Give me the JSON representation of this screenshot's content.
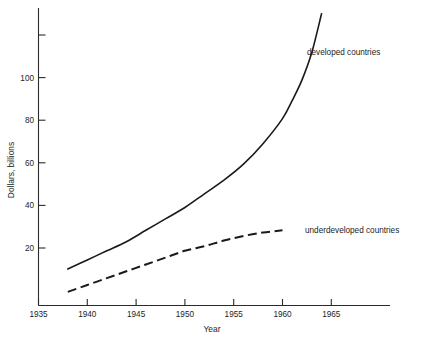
{
  "chart_data": {
    "type": "line",
    "title": "",
    "xlabel": "Year",
    "ylabel": "Dollars, billions",
    "xlim": [
      1935,
      1972
    ],
    "ylim": [
      0,
      128
    ],
    "grid": false,
    "legend_position": "inline-right-of-curves",
    "x_ticks": [
      1935,
      1940,
      1945,
      1950,
      1955,
      1960,
      1965
    ],
    "x_tick_labels": [
      "1935",
      "1940",
      "1945",
      "1950",
      "1955",
      "1960",
      "1965"
    ],
    "y_ticks": [
      20,
      40,
      60,
      80,
      100,
      120
    ],
    "y_tick_labels": [
      "20",
      "40",
      "60",
      "80",
      "100",
      ""
    ],
    "series": [
      {
        "name": "developed countries",
        "style": "solid",
        "label": "developed countries",
        "x": [
          1938,
          1940,
          1942,
          1944,
          1946,
          1948,
          1950,
          1952,
          1954,
          1956,
          1958,
          1960,
          1961,
          1962,
          1963,
          1964
        ],
        "values": [
          16,
          20,
          24,
          28,
          33,
          38,
          43,
          49,
          55,
          62,
          71,
          82,
          90,
          99,
          111,
          128
        ]
      },
      {
        "name": "underdeveloped countries",
        "style": "dashed",
        "label": "underdeveloped countries",
        "x": [
          1938,
          1940,
          1942,
          1944,
          1946,
          1948,
          1950,
          1952,
          1954,
          1956,
          1958,
          1960
        ],
        "values": [
          6,
          9,
          12,
          15,
          18,
          21,
          24,
          26,
          28.5,
          30.5,
          32,
          33
        ]
      }
    ]
  },
  "axes": {
    "x_title": "Year",
    "y_title": "Dollars, billions"
  },
  "labels": {
    "developed": "developed countries",
    "underdeveloped": "underdeveloped countries"
  },
  "ticks": {
    "x": [
      "1935",
      "1940",
      "1945",
      "1950",
      "1955",
      "1960",
      "1965"
    ],
    "y": [
      "20",
      "40",
      "60",
      "80",
      "100"
    ]
  },
  "colors": {
    "ink": "#1a1a1a",
    "background": "#ffffff"
  }
}
